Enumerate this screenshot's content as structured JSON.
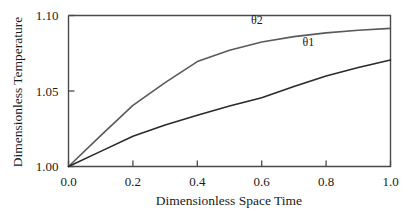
{
  "chart_data": {
    "type": "line",
    "title": "",
    "xlabel": "Dimensionless Space Time",
    "ylabel": "Dimensionless Temperature",
    "xlim": [
      0.0,
      1.0
    ],
    "ylim": [
      1.0,
      1.1
    ],
    "grid": false,
    "legend_position": "inline-annotation",
    "xticks": [
      "0.0",
      "0.2",
      "0.4",
      "0.6",
      "0.8",
      "1.0"
    ],
    "xtick_values": [
      0.0,
      0.2,
      0.4,
      0.6,
      0.8,
      1.0
    ],
    "yticks": [
      "1.00",
      "1.05",
      "1.10"
    ],
    "ytick_values": [
      1.0,
      1.05,
      1.1
    ],
    "x": [
      0.0,
      0.1,
      0.2,
      0.3,
      0.4,
      0.5,
      0.6,
      0.7,
      0.8,
      0.9,
      1.0
    ],
    "series": [
      {
        "name": "θ2",
        "label": "θ2",
        "color": "#5a5a5a",
        "values": [
          1.0,
          1.0205,
          1.0405,
          1.0555,
          1.0695,
          1.077,
          1.0825,
          1.086,
          1.0885,
          1.0902,
          1.0915
        ],
        "label_x": 0.585,
        "label_y": 1.0945
      },
      {
        "name": "θ1",
        "label": "θ1",
        "color": "#2a2a2a",
        "values": [
          1.0,
          1.01,
          1.02,
          1.0275,
          1.034,
          1.04,
          1.0455,
          1.053,
          1.06,
          1.0655,
          1.0705
        ],
        "label_x": 0.745,
        "label_y": 1.0795
      }
    ]
  },
  "axes": {
    "x_axis_title": "Dimensionless Space Time",
    "y_axis_title": "Dimensionless Temperature",
    "x_tick_labels": [
      "0.0",
      "0.2",
      "0.4",
      "0.6",
      "0.8",
      "1.0"
    ],
    "y_tick_labels": [
      "1.00",
      "1.05",
      "1.10"
    ]
  },
  "annotations": {
    "theta2_label": "θ2",
    "theta1_label": "θ1"
  }
}
